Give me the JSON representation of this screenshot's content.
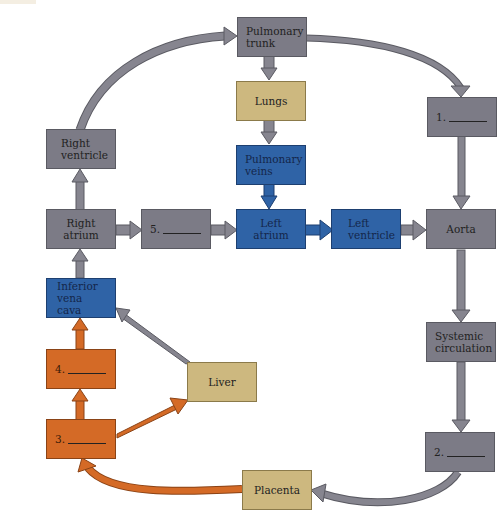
{
  "colors": {
    "gray_box": "#7c7b86",
    "tan_box": "#cdb87f",
    "blue_box": "#2f63a6",
    "orange_box": "#d46a26",
    "gray_arrow": "#86858f",
    "blue_arrow": "#2f63a6",
    "orange_arrow": "#d46a26"
  },
  "nodes": {
    "pulmonary_trunk": {
      "line1": "Pulmonary",
      "line2": "trunk"
    },
    "lungs": {
      "label": "Lungs"
    },
    "pulmonary_veins": {
      "line1": "Pulmonary",
      "line2": "veins"
    },
    "right_ventricle": {
      "line1": "Right",
      "line2": "ventricle"
    },
    "right_atrium": {
      "line1": "Right",
      "line2": "atrium"
    },
    "blank5": {
      "number": "5."
    },
    "left_atrium": {
      "line1": "Left",
      "line2": "atrium"
    },
    "left_ventricle": {
      "line1": "Left",
      "line2": "ventricle"
    },
    "aorta": {
      "label": "Aorta"
    },
    "blank1": {
      "number": "1."
    },
    "systemic_circulation": {
      "line1": "Systemic",
      "line2": "circulation"
    },
    "blank2": {
      "number": "2."
    },
    "inferior_vena_cava": {
      "line1": "Inferior",
      "line2": "vena cava"
    },
    "blank4": {
      "number": "4."
    },
    "blank3": {
      "number": "3."
    },
    "liver": {
      "label": "Liver"
    },
    "placenta": {
      "label": "Placenta"
    }
  }
}
